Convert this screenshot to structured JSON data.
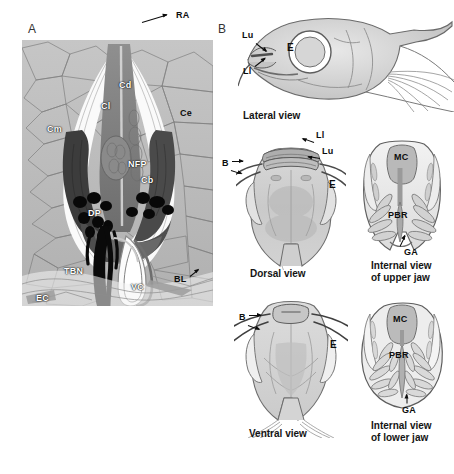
{
  "figure": {
    "panels": [
      {
        "id": "A",
        "letter": "A",
        "type": "histological-section",
        "description": "Transverse histological section through a barbel showing taste buds and nerve fibres",
        "labels": [
          {
            "key": "RA",
            "text": "RA",
            "meaning": "ridge apex",
            "style": "black",
            "x": 176,
            "y": 16
          },
          {
            "key": "Cd",
            "text": "Cd",
            "meaning": "dermal core",
            "style": "white",
            "x": 119,
            "y": 86
          },
          {
            "key": "Cl",
            "text": "Cl",
            "meaning": "central core lateral",
            "style": "white",
            "x": 101,
            "y": 107
          },
          {
            "key": "Cm",
            "text": "Cm",
            "meaning": "core medial",
            "style": "white",
            "x": 47,
            "y": 130
          },
          {
            "key": "Ce",
            "text": "Ce",
            "meaning": "epidermal cells",
            "style": "black",
            "x": 180,
            "y": 114
          },
          {
            "key": "NFP",
            "text": "NFP",
            "meaning": "nerve fibre plexus",
            "style": "white",
            "x": 128,
            "y": 165
          },
          {
            "key": "Cb",
            "text": "Cb",
            "meaning": "basal core",
            "style": "white",
            "x": 141,
            "y": 181
          },
          {
            "key": "DP",
            "text": "DP",
            "meaning": "dermal papilla",
            "style": "white",
            "x": 88,
            "y": 214
          },
          {
            "key": "TBN",
            "text": "TBN",
            "meaning": "taste bud nerve",
            "style": "white",
            "x": 64,
            "y": 272
          },
          {
            "key": "VC",
            "text": "VC",
            "meaning": "vascular channel",
            "style": "white",
            "x": 131,
            "y": 288
          },
          {
            "key": "BL",
            "text": "BL",
            "meaning": "basal lamina",
            "style": "black",
            "x": 174,
            "y": 280
          },
          {
            "key": "EC",
            "text": "EC",
            "meaning": "endothelial cells",
            "style": "white",
            "x": 36,
            "y": 299
          }
        ]
      },
      {
        "id": "B",
        "letter": "B",
        "type": "schematic-drawings",
        "views": [
          {
            "name": "lateral",
            "caption": "Lateral view",
            "caption_x": 243,
            "caption_y": 110,
            "labels": [
              {
                "key": "Lu",
                "text": "Lu",
                "meaning": "upper lip",
                "x": 242,
                "y": 36
              },
              {
                "key": "Ll",
                "text": "Ll",
                "meaning": "lower lip",
                "x": 243,
                "y": 72
              },
              {
                "key": "E",
                "text": "E",
                "meaning": "eye",
                "x": 290,
                "y": 48
              }
            ]
          },
          {
            "name": "dorsal",
            "caption": "Dorsal view",
            "caption_x": 250,
            "caption_y": 268,
            "labels": [
              {
                "key": "Ll",
                "text": "Ll",
                "meaning": "lower lip",
                "x": 316,
                "y": 136
              },
              {
                "key": "Lu",
                "text": "Lu",
                "meaning": "upper lip",
                "x": 322,
                "y": 152
              },
              {
                "key": "B",
                "text": "B",
                "meaning": "barbels",
                "x": 227,
                "y": 164
              },
              {
                "key": "E",
                "text": "E",
                "meaning": "eye",
                "x": 329,
                "y": 185
              }
            ]
          },
          {
            "name": "internal-upper-jaw",
            "caption": "Internal view\nof upper jaw",
            "caption_x": 371,
            "caption_y": 264,
            "labels": [
              {
                "key": "MC",
                "text": "MC",
                "meaning": "mouth cavity",
                "x": 394,
                "y": 158
              },
              {
                "key": "PBR",
                "text": "PBR",
                "meaning": "palatal brush region",
                "x": 388,
                "y": 216
              },
              {
                "key": "GA",
                "text": "GA",
                "meaning": "gill arch",
                "x": 404,
                "y": 253
              }
            ]
          },
          {
            "name": "ventral",
            "caption": "Ventral view",
            "caption_x": 249,
            "caption_y": 428,
            "labels": [
              {
                "key": "B",
                "text": "B",
                "meaning": "barbels",
                "x": 243,
                "y": 318
              },
              {
                "key": "E",
                "text": "E",
                "meaning": "eye",
                "x": 330,
                "y": 345
              }
            ]
          },
          {
            "name": "internal-lower-jaw",
            "caption": "Internal view\nof lower jaw",
            "caption_x": 371,
            "caption_y": 424,
            "labels": [
              {
                "key": "MC",
                "text": "MC",
                "meaning": "mouth cavity",
                "x": 393,
                "y": 320
              },
              {
                "key": "PBR",
                "text": "PBR",
                "meaning": "palatal brush region",
                "x": 389,
                "y": 356
              },
              {
                "key": "GA",
                "text": "GA",
                "meaning": "gill arch",
                "x": 402,
                "y": 411
              }
            ]
          }
        ]
      }
    ],
    "colors": {
      "background": "#ffffff",
      "label_black": "#0d0d0d",
      "label_white": "#ffffff",
      "tissue_gray": "#b9b9b9",
      "dark_structure": "#0a0a0a",
      "mid_gray": "#8c8c8c",
      "drawing_outline": "#5a5a5a",
      "drawing_fill": "#d8d8d8"
    }
  }
}
